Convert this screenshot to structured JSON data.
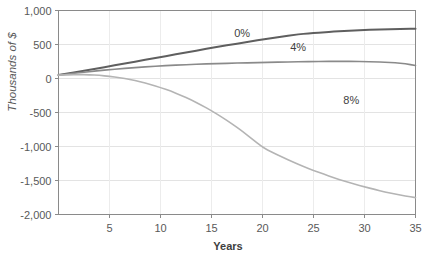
{
  "chart_data": {
    "type": "line",
    "title": "",
    "xlabel": "Years",
    "ylabel": "Thousands of $",
    "xlim": [
      0,
      35
    ],
    "ylim": [
      -2000,
      1000
    ],
    "grid": true,
    "legend_position": "inline-annotations",
    "x_ticks": [
      "5",
      "10",
      "15",
      "20",
      "25",
      "30",
      "35"
    ],
    "x_tick_values": [
      5,
      10,
      15,
      20,
      25,
      30,
      35
    ],
    "y_ticks": [
      "1,000",
      "500",
      "0",
      "-500",
      "-1,000",
      "-1,500",
      "-2,000"
    ],
    "y_tick_values": [
      1000,
      500,
      0,
      -500,
      -1000,
      -1500,
      -2000
    ],
    "x": [
      0,
      1,
      2,
      3,
      4,
      5,
      6,
      7,
      8,
      9,
      10,
      11,
      12,
      13,
      14,
      15,
      16,
      17,
      18,
      19,
      20,
      21,
      22,
      23,
      24,
      25,
      26,
      27,
      28,
      29,
      30,
      31,
      32,
      33,
      34,
      35
    ],
    "series": [
      {
        "name": "0%",
        "label": "0%",
        "color": "#5f5f5f",
        "width": 2.0,
        "label_x": 18,
        "label_y": 610,
        "values": [
          50,
          75,
          101,
          127,
          153,
          180,
          207,
          234,
          261,
          288,
          315,
          342,
          369,
          396,
          423,
          449,
          475,
          500,
          525,
          549,
          573,
          596,
          618,
          639,
          659,
          667,
          678,
          689,
          698,
          706,
          713,
          718,
          722,
          726,
          729,
          731
        ]
      },
      {
        "name": "4%",
        "label": "4%",
        "color": "#8a8a8a",
        "width": 1.6,
        "label_x": 23.5,
        "label_y": 405,
        "values": [
          50,
          68,
          85,
          101,
          116,
          130,
          143,
          155,
          166,
          176,
          185,
          193,
          200,
          206,
          212,
          217,
          221,
          225,
          229,
          232,
          236,
          239,
          242,
          245,
          247,
          249,
          251,
          252,
          252,
          251,
          249,
          245,
          240,
          231,
          217,
          192
        ]
      },
      {
        "name": "8%",
        "label": "8%",
        "color": "#b4b4b4",
        "width": 1.6,
        "label_x": 28.7,
        "label_y": -370,
        "values": [
          50,
          56,
          58,
          55,
          46,
          32,
          12,
          -14,
          -47,
          -86,
          -132,
          -185,
          -246,
          -314,
          -390,
          -474,
          -566,
          -666,
          -774,
          -890,
          -1014,
          -1090,
          -1160,
          -1228,
          -1292,
          -1352,
          -1408,
          -1460,
          -1508,
          -1552,
          -1592,
          -1632,
          -1668,
          -1700,
          -1728,
          -1752
        ]
      }
    ]
  }
}
